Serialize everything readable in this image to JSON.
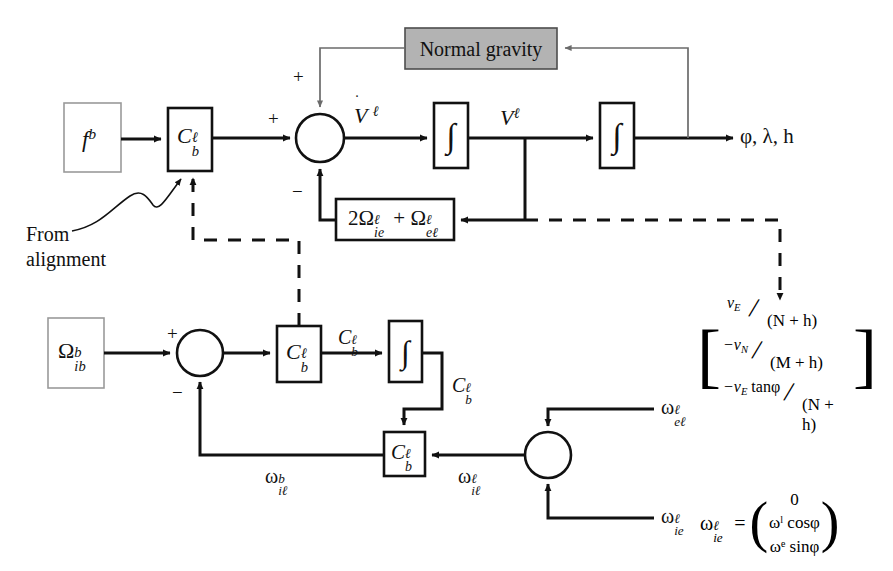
{
  "diagram": {
    "blocks": {
      "accel_input": {
        "name": "specific-force-input",
        "label": "f",
        "sup": "b",
        "sub": ""
      },
      "gyro_input": {
        "name": "angular-rate-input",
        "label": "Ω",
        "sup": "b",
        "sub": "ib"
      },
      "dcm_accel": {
        "name": "dcm-accel",
        "label": "C",
        "sup": "ℓ",
        "sub": "b"
      },
      "dcm_gyro": {
        "name": "dcm-gyro",
        "label": "C",
        "sup": "ℓ",
        "sub": "b"
      },
      "dcm_feedback": {
        "name": "dcm-feedback",
        "label": "C",
        "sup": "ℓ",
        "sub": "b"
      },
      "normal_gravity": {
        "name": "normal-gravity",
        "label": "Normal gravity",
        "fill": "#b3b3b3",
        "stroke": "#4d4d4d"
      },
      "coriolis": {
        "name": "coriolis-term",
        "label": "2Ω",
        "sup1": "ℓ",
        "sub1": "ie",
        "plus": " + ",
        "label2": "Ω",
        "sup2": "ℓ",
        "sub2": "eℓ"
      },
      "integrator_1": {
        "name": "integrator-velocity",
        "label": "∫"
      },
      "integrator_2": {
        "name": "integrator-position",
        "label": "∫"
      },
      "integrator_3": {
        "name": "integrator-attitude",
        "label": "∫"
      }
    },
    "junctions": {
      "velocity_sum": {
        "name": "velocity-summing-junction",
        "signs": [
          "+",
          "+",
          "−"
        ]
      },
      "attitude_sum": {
        "name": "attitude-summing-junction",
        "signs": [
          "+",
          "−"
        ]
      },
      "rate_sum": {
        "name": "rate-summing-junction",
        "signs": []
      }
    },
    "signal_labels": {
      "v_dot": {
        "name": "velocity-rate-label",
        "base": "V",
        "sup": "ℓ",
        "dot": true
      },
      "velocity": {
        "name": "velocity-label",
        "base": "V",
        "sup": "ℓ"
      },
      "position": {
        "name": "position-output-label",
        "text": "φ, λ, h"
      },
      "cbl_after_gyro": {
        "name": "dcm-label-top",
        "base": "C",
        "sup": "ℓ",
        "sub": "b"
      },
      "cbl_after_integrator": {
        "name": "dcm-label-mid",
        "base": "C",
        "sup": "ℓ",
        "sub": "b"
      },
      "omega_ib_b": {
        "name": "omega-il-b-label",
        "base": "ω",
        "sup": "b",
        "sub": "iℓ"
      },
      "omega_il_l": {
        "name": "omega-il-l-label",
        "base": "ω",
        "sup": "ℓ",
        "sub": "iℓ"
      },
      "omega_el_l": {
        "name": "omega-el-l-label",
        "base": "ω",
        "sup": "ℓ",
        "sub": "eℓ"
      },
      "omega_ie_l": {
        "name": "omega-ie-l-label",
        "base": "ω",
        "sup": "ℓ",
        "sub": "ie"
      }
    },
    "annotations": {
      "from_alignment": {
        "name": "from-alignment-note",
        "line1": "From",
        "line2": "alignment"
      }
    },
    "equations": {
      "omega_el_vector": {
        "name": "omega-el-vector-equation",
        "rows": [
          {
            "num": "v",
            "num_sub": "E",
            "den": "(N + h)",
            "sign": ""
          },
          {
            "num": "−v",
            "num_sub": "N",
            "den": "(M + h)",
            "sign": ""
          },
          {
            "num": "−v",
            "num_sub": "E",
            "num_tail": " tanφ",
            "den": "(N + h)",
            "sign": ""
          }
        ]
      },
      "omega_ie_vector": {
        "name": "omega-ie-vector-equation",
        "lhs": "ω",
        "lhs_sup": "ℓ",
        "lhs_sub": "ie",
        "equals": "=",
        "rows": [
          "0",
          "ωˡ cosφ",
          "ωᵉ sinφ"
        ]
      }
    },
    "colors": {
      "ink": "#111111",
      "thin_line": "#6b6b6b",
      "gray_fill": "#b3b3b3",
      "light_box_stroke": "#9a9a9a",
      "background": "#ffffff"
    }
  }
}
